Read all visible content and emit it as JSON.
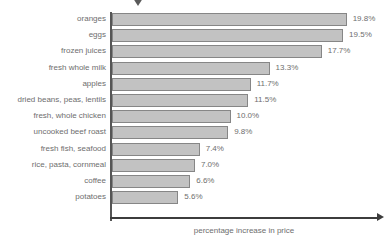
{
  "chart_data": {
    "type": "bar",
    "orientation": "horizontal",
    "title": "",
    "xlabel": "percentage increase in price",
    "ylabel": "",
    "categories": [
      "oranges",
      "eggs",
      "frozen juices",
      "fresh whole milk",
      "apples",
      "dried beans, peas, lentils",
      "fresh, whole chicken",
      "uncooked beef roast",
      "fresh fish, seafood",
      "rice, pasta, cornmeal",
      "coffee",
      "potatoes"
    ],
    "values": [
      19.8,
      19.5,
      17.7,
      13.3,
      11.7,
      11.5,
      10.0,
      9.8,
      7.4,
      7.0,
      6.6,
      5.6
    ],
    "value_labels": [
      "19.8%",
      "19.5%",
      "17.7%",
      "13.3%",
      "11.7%",
      "11.5%",
      "10.0%",
      "9.8%",
      "7.4%",
      "7.0%",
      "6.6%",
      "5.6%"
    ],
    "xlim": [
      0,
      19.8
    ],
    "grid": false,
    "legend": null,
    "bar_color": "#c2c2c2",
    "bar_border_color": "#868686",
    "text_color": "#6e6e6e",
    "axis_color": "#3c3c3c",
    "axis_arrow": "right-arrowhead"
  },
  "decoration": {
    "top_marker": "down-triangle-marker"
  }
}
